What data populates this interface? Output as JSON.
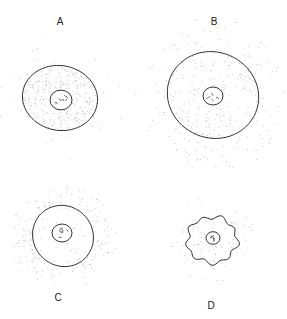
{
  "figure": {
    "panels": [
      {
        "id": "A",
        "label": "A",
        "label_pos": [
          60,
          21
        ],
        "cx": 60,
        "cy": 98,
        "rx": 37,
        "ry": 33,
        "membrane": "smooth",
        "inner_density": "dense",
        "outer_density": "sparse",
        "nucleus": {
          "cx": 61,
          "cy": 100,
          "r": 11
        }
      },
      {
        "id": "B",
        "label": "B",
        "label_pos": [
          214,
          21
        ],
        "cx": 213,
        "cy": 95,
        "rx": 45,
        "ry": 44,
        "membrane": "smooth",
        "inner_density": "medium",
        "outer_density": "medium",
        "nucleus": {
          "cx": 213,
          "cy": 96,
          "r": 10
        }
      },
      {
        "id": "C",
        "label": "C",
        "label_pos": [
          58,
          297
        ],
        "cx": 63,
        "cy": 236,
        "rx": 30,
        "ry": 31,
        "membrane": "smooth",
        "inner_density": "sparse",
        "outer_density": "dense",
        "nucleus": {
          "cx": 62,
          "cy": 233,
          "r": 10
        }
      },
      {
        "id": "D",
        "label": "D",
        "label_pos": [
          211,
          305
        ],
        "cx": 212,
        "cy": 240,
        "rx": 25,
        "ry": 23,
        "membrane": "crenated",
        "inner_density": "medium",
        "outer_density": "medium",
        "nucleus": {
          "cx": 213,
          "cy": 238,
          "r": 7
        }
      }
    ],
    "colors": {
      "line": "#333333",
      "stipple": "#8a8a8a",
      "background": "#ffffff"
    }
  }
}
